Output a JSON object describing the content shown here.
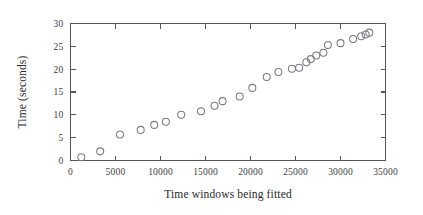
{
  "figure": {
    "background_color": "#ffffff",
    "frame_color": "#55565a",
    "marker_color": "#7b7c80",
    "text_color": "#26272b"
  },
  "chart_data": {
    "type": "scatter",
    "title": "",
    "xlabel": "Time windows being fitted",
    "ylabel": "Time (seconds)",
    "xlim": [
      0,
      35000
    ],
    "ylim": [
      0,
      30
    ],
    "xticks": [
      0,
      5000,
      10000,
      15000,
      20000,
      25000,
      30000,
      35000
    ],
    "yticks": [
      0,
      5,
      10,
      15,
      20,
      25,
      30
    ],
    "xtick_labels": [
      "0",
      "5000",
      "10000",
      "15000",
      "20000",
      "25000",
      "30000",
      "35000"
    ],
    "ytick_labels": [
      "0",
      "5",
      "10",
      "15",
      "20",
      "25",
      "30"
    ],
    "grid": false,
    "legend": null,
    "marker_style": "open-circle",
    "marker_size": 7,
    "x": [
      1200,
      3300,
      5500,
      7800,
      9300,
      10600,
      12300,
      14500,
      16000,
      16900,
      18800,
      20200,
      21800,
      23100,
      24600,
      25400,
      26200,
      26700,
      27300,
      28100,
      28600,
      30000,
      31400,
      32300,
      32800,
      33200
    ],
    "y": [
      0.7,
      2.0,
      5.7,
      6.7,
      7.8,
      8.5,
      10.0,
      10.8,
      12.0,
      13.0,
      14.0,
      15.9,
      18.3,
      19.4,
      20.1,
      20.3,
      21.5,
      22.2,
      23.0,
      23.6,
      25.3,
      25.7,
      26.6,
      27.2,
      27.6,
      28.0
    ]
  }
}
